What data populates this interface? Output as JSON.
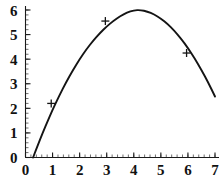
{
  "chart_data": {
    "type": "line",
    "title": "",
    "xlabel": "",
    "ylabel": "",
    "xlim": [
      0,
      7
    ],
    "ylim": [
      0,
      6
    ],
    "grid": false,
    "legend": null,
    "xticks": [
      0,
      1,
      2,
      3,
      4,
      5,
      6,
      7
    ],
    "xtick_labels": [
      "0",
      "1",
      "2",
      "3",
      "4",
      "5",
      "6",
      "7"
    ],
    "yticks": [
      0,
      1,
      2,
      3,
      4,
      5,
      6
    ],
    "ytick_labels": [
      "0",
      "1",
      "2",
      "3",
      "4",
      "5",
      "6"
    ],
    "minor_tick_step": 0.2,
    "curve": {
      "name": "parabola",
      "shape": "downward parabola",
      "vertex": [
        4,
        6
      ],
      "x_start": 0.28,
      "x_end": 7.0,
      "y_at_x_start": 0.0,
      "y_at_x_end": 2.2,
      "x": [
        0.28,
        0.5,
        0.75,
        1.0,
        1.25,
        1.5,
        1.75,
        2.0,
        2.25,
        2.5,
        2.75,
        3.0,
        3.25,
        3.5,
        3.75,
        4.0,
        4.25,
        4.5,
        4.75,
        5.0,
        5.25,
        5.5,
        5.75,
        6.0,
        6.25,
        6.5,
        6.75,
        7.0
      ],
      "y": [
        0.0,
        0.63,
        1.31,
        1.94,
        2.52,
        3.06,
        3.55,
        4.0,
        4.4,
        4.75,
        5.06,
        5.33,
        5.56,
        5.75,
        5.89,
        5.99,
        6.0,
        5.94,
        5.82,
        5.65,
        5.43,
        5.15,
        4.83,
        4.45,
        4.03,
        3.56,
        3.05,
        2.48
      ]
    },
    "markers": [
      {
        "label": "point-1",
        "x": 0.95,
        "y": 2.2,
        "style": "plus"
      },
      {
        "label": "point-2",
        "x": 2.95,
        "y": 5.55,
        "style": "plus"
      },
      {
        "label": "point-3",
        "x": 5.95,
        "y": 4.25,
        "style": "plus"
      }
    ]
  },
  "figure": {
    "background_color": "#ffffff",
    "curve_color": "#141414",
    "axis_color": "#1a1a1a",
    "label_color": "#111111"
  }
}
